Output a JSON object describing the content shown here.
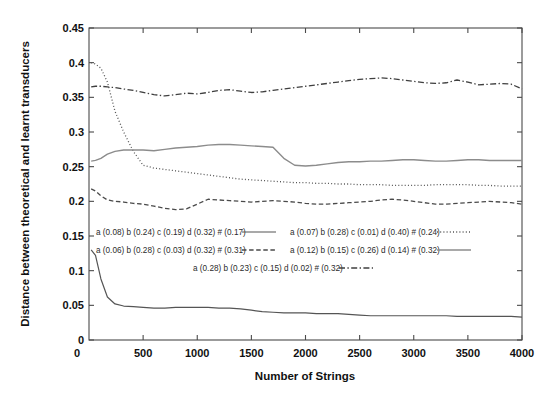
{
  "chart_data": {
    "type": "line",
    "title": "",
    "xlabel": "Number of Strings",
    "ylabel": "Distance between theoretical and learnt transducers",
    "xlim": [
      0,
      4000
    ],
    "ylim": [
      0,
      0.45
    ],
    "xticks": [
      0,
      500,
      1000,
      1500,
      2000,
      2500,
      3000,
      3500,
      4000
    ],
    "xtick_labels": [
      "0",
      "500",
      "1000",
      "1500",
      "2000",
      "2500",
      "3000",
      "3500",
      "4000"
    ],
    "yticks": [
      0,
      0.05,
      0.1,
      0.15,
      0.2,
      0.25,
      0.3,
      0.35,
      0.4,
      0.45
    ],
    "ytick_labels": [
      "0",
      "0.05",
      "0.1",
      "0.15",
      "0.2",
      "0.25",
      "0.3",
      "0.35",
      "0.4",
      "0.45"
    ],
    "grid": false,
    "legend_position": "inside-center",
    "x": [
      20,
      60,
      110,
      170,
      240,
      320,
      410,
      500,
      600,
      700,
      800,
      900,
      1000,
      1100,
      1200,
      1300,
      1400,
      1500,
      1600,
      1700,
      1800,
      1900,
      2000,
      2100,
      2200,
      2300,
      2400,
      2500,
      2600,
      2700,
      2800,
      2900,
      3000,
      3100,
      3200,
      3300,
      3400,
      3500,
      3600,
      3700,
      3800,
      3900,
      4000
    ],
    "series": [
      {
        "name": "a (0.08) b (0.24) c (0.19) d (0.32) # (0.17)",
        "style": "solid",
        "color": "#555555",
        "width": 1.2,
        "values": [
          0.13,
          0.122,
          0.088,
          0.062,
          0.052,
          0.049,
          0.048,
          0.047,
          0.046,
          0.046,
          0.047,
          0.047,
          0.047,
          0.047,
          0.046,
          0.046,
          0.045,
          0.043,
          0.041,
          0.04,
          0.039,
          0.039,
          0.039,
          0.038,
          0.038,
          0.038,
          0.037,
          0.036,
          0.035,
          0.035,
          0.035,
          0.035,
          0.035,
          0.035,
          0.035,
          0.035,
          0.034,
          0.034,
          0.034,
          0.034,
          0.034,
          0.034,
          0.033
        ]
      },
      {
        "name": "a (0.07) b (0.28) c (0.01) d (0.40) # (0.24)",
        "style": "dotted",
        "color": "#555555",
        "width": 1.3,
        "values": [
          0.4,
          0.398,
          0.392,
          0.372,
          0.33,
          0.3,
          0.272,
          0.252,
          0.248,
          0.246,
          0.244,
          0.242,
          0.24,
          0.238,
          0.236,
          0.234,
          0.232,
          0.231,
          0.23,
          0.229,
          0.228,
          0.227,
          0.227,
          0.226,
          0.226,
          0.225,
          0.225,
          0.224,
          0.224,
          0.224,
          0.223,
          0.223,
          0.223,
          0.223,
          0.224,
          0.224,
          0.224,
          0.224,
          0.223,
          0.223,
          0.222,
          0.222,
          0.222
        ]
      },
      {
        "name": "a (0.06) b (0.28) c (0.03) d (0.32) # (0.31)",
        "style": "dashed",
        "color": "#4a4a4a",
        "width": 1.3,
        "values": [
          0.218,
          0.215,
          0.208,
          0.202,
          0.2,
          0.199,
          0.197,
          0.196,
          0.193,
          0.19,
          0.188,
          0.189,
          0.196,
          0.203,
          0.202,
          0.201,
          0.2,
          0.199,
          0.2,
          0.201,
          0.2,
          0.199,
          0.197,
          0.196,
          0.196,
          0.197,
          0.198,
          0.199,
          0.2,
          0.202,
          0.203,
          0.202,
          0.2,
          0.198,
          0.196,
          0.196,
          0.197,
          0.198,
          0.199,
          0.2,
          0.199,
          0.198,
          0.196
        ]
      },
      {
        "name": "a (0.12) b (0.15) c (0.26) d (0.14) # (0.32)",
        "style": "solid-light",
        "color": "#8c8c8c",
        "width": 1.4,
        "values": [
          0.258,
          0.259,
          0.262,
          0.268,
          0.272,
          0.274,
          0.274,
          0.274,
          0.273,
          0.275,
          0.277,
          0.278,
          0.279,
          0.281,
          0.282,
          0.282,
          0.281,
          0.28,
          0.279,
          0.278,
          0.262,
          0.252,
          0.251,
          0.252,
          0.254,
          0.256,
          0.257,
          0.257,
          0.258,
          0.258,
          0.259,
          0.26,
          0.26,
          0.259,
          0.258,
          0.258,
          0.259,
          0.26,
          0.26,
          0.259,
          0.259,
          0.259,
          0.259
        ]
      },
      {
        "name": "a (0.28) b (0.23) c (0.15) d (0.02) # (0.32)",
        "style": "dashdot",
        "color": "#3f3f3f",
        "width": 1.3,
        "values": [
          0.365,
          0.366,
          0.366,
          0.365,
          0.364,
          0.362,
          0.36,
          0.357,
          0.354,
          0.352,
          0.354,
          0.356,
          0.355,
          0.357,
          0.36,
          0.361,
          0.359,
          0.357,
          0.358,
          0.36,
          0.362,
          0.364,
          0.366,
          0.368,
          0.37,
          0.372,
          0.374,
          0.376,
          0.377,
          0.378,
          0.377,
          0.375,
          0.373,
          0.371,
          0.37,
          0.371,
          0.375,
          0.372,
          0.368,
          0.369,
          0.37,
          0.369,
          0.362
        ]
      }
    ],
    "legend": {
      "rows": [
        {
          "left": {
            "label": "a (0.08) b (0.24) c (0.19) d (0.32) # (0.17)",
            "style": "solid"
          },
          "right": {
            "label": "a (0.07) b (0.28) c (0.01) d (0.40) # (0.24)",
            "style": "dotted"
          }
        },
        {
          "left": {
            "label": "a (0.06) b (0.28) c (0.03) d (0.32) # (0.31)",
            "style": "dashed"
          },
          "right": {
            "label": "a (0.12) b (0.15) c (0.26) d (0.14) # (0.32)",
            "style": "solid-light"
          }
        }
      ],
      "center_row": {
        "label": "a (0.28) b (0.23) c (0.15) d (0.02) # (0.32)",
        "style": "dashdot"
      }
    }
  }
}
